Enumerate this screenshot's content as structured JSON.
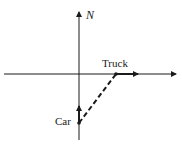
{
  "diagram": {
    "title": "",
    "labels": {
      "north": "N",
      "truck": "Truck",
      "car": "Car"
    },
    "axes": {
      "vertical": "north-south axis with arrow pointing up (N)",
      "horizontal": "east-west axis with arrow pointing right"
    },
    "vectors": [
      {
        "name": "truck-velocity",
        "from": "truck position on horizontal axis",
        "direction": "east",
        "style": "solid"
      },
      {
        "name": "car-velocity",
        "from": "car position on vertical axis",
        "direction": "north",
        "style": "solid"
      },
      {
        "name": "relative-position",
        "from": "car",
        "to": "truck",
        "style": "dashed"
      }
    ],
    "colors": {
      "ink": "#1a1a1a",
      "background": "#ffffff"
    }
  }
}
